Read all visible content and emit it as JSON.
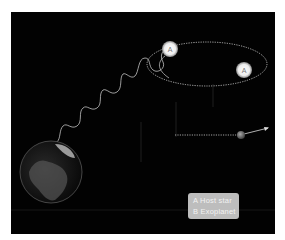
{
  "figure": {
    "star_label_1": "A",
    "star_label_2": "A",
    "colors": {
      "background": "#020202",
      "orbit": "#d8d8d8",
      "star": "#f4f4f4",
      "legend_bg": "#bdbdbd",
      "legend_text": "#f2f2f2"
    }
  },
  "legend": {
    "items": [
      {
        "key": "A",
        "label": "A  Host star"
      },
      {
        "key": "B",
        "label": "B  Exoplanet"
      }
    ]
  }
}
